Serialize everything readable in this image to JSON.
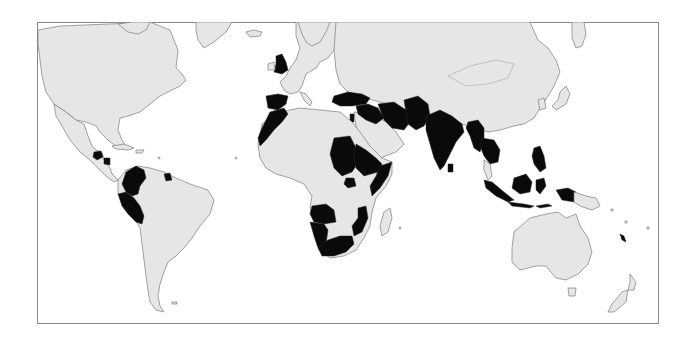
{
  "map": {
    "title": "",
    "projection": "world, equatorial cylindrical",
    "frame": {
      "x": 37,
      "y": 22,
      "width": 622,
      "height": 302,
      "stroke": "#8a8a8a"
    },
    "colors": {
      "background": "#ffffff",
      "land_default": "#e6e6e6",
      "land_highlighted": "#0a0a0a",
      "coastline": "#7d7d7d"
    },
    "legend": null,
    "highlighted_regions": [
      "United Kingdom",
      "Spain",
      "Morocco",
      "Western Sahara",
      "Turkey",
      "Syria",
      "Iraq",
      "Iran",
      "Afghanistan",
      "Pakistan",
      "Israel",
      "India",
      "Sri Lanka",
      "Bangladesh",
      "Myanmar",
      "Thailand",
      "Cambodia",
      "Philippines",
      "Indonesia",
      "Papua (Indonesia)",
      "Sudan",
      "Eritrea",
      "Ethiopia",
      "Somalia",
      "Uganda",
      "Rwanda",
      "Angola",
      "Namibia",
      "Mozambique",
      "South Africa",
      "Guatemala",
      "Nicaragua",
      "Colombia",
      "Peru",
      "Suriname",
      "Solomon Islands"
    ]
  }
}
